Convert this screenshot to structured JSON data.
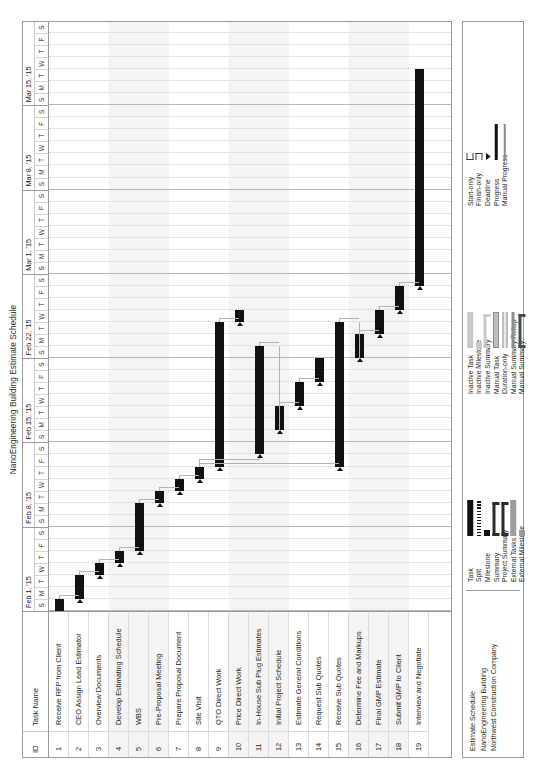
{
  "document": {
    "title": "NanoEngineering Building Estimate Schedule"
  },
  "table": {
    "headers": {
      "id": "ID",
      "name": "Task Name"
    },
    "rows": [
      {
        "id": "1",
        "name": "Receive RFP from Client"
      },
      {
        "id": "2",
        "name": "CEO Assign Lead Estimator"
      },
      {
        "id": "3",
        "name": "Overview Documents"
      },
      {
        "id": "4",
        "name": "Develop Estimating Schedule"
      },
      {
        "id": "5",
        "name": "WBS"
      },
      {
        "id": "6",
        "name": "Pre-Proposal Meeting"
      },
      {
        "id": "7",
        "name": "Prepare Proposal Document"
      },
      {
        "id": "8",
        "name": "Site Visit"
      },
      {
        "id": "9",
        "name": "QTO Direct Work"
      },
      {
        "id": "10",
        "name": "Price Direct Work"
      },
      {
        "id": "11",
        "name": "In-House Sub Plug Estimates"
      },
      {
        "id": "12",
        "name": "Initial Project Schedule"
      },
      {
        "id": "13",
        "name": "Estimate General Conditions"
      },
      {
        "id": "14",
        "name": "Request Sub Quotes"
      },
      {
        "id": "15",
        "name": "Receive Sub Quotes"
      },
      {
        "id": "16",
        "name": "Determine Fee and Markups"
      },
      {
        "id": "17",
        "name": "Final GMP Estimate"
      },
      {
        "id": "18",
        "name": "Submit GMP to Client"
      },
      {
        "id": "19",
        "name": "Interview and Negotiate"
      }
    ]
  },
  "timescale": {
    "weeks": [
      {
        "label": "Feb 1, '15",
        "days": [
          "S",
          "M",
          "T",
          "W",
          "T",
          "F",
          "S"
        ]
      },
      {
        "label": "Feb 8, '15",
        "days": [
          "S",
          "M",
          "T",
          "W",
          "T",
          "F",
          "S"
        ]
      },
      {
        "label": "Feb 15, '15",
        "days": [
          "S",
          "M",
          "T",
          "W",
          "T",
          "F",
          "S"
        ]
      },
      {
        "label": "Feb 22, '15",
        "days": [
          "S",
          "M",
          "T",
          "W",
          "T",
          "F",
          "S"
        ]
      },
      {
        "label": "Mar 1, '15",
        "days": [
          "S",
          "M",
          "T",
          "W",
          "T",
          "F",
          "S"
        ]
      },
      {
        "label": "Mar 8, '15",
        "days": [
          "S",
          "M",
          "T",
          "W",
          "T",
          "F",
          "S"
        ]
      },
      {
        "label": "Mar 15, '15",
        "days": [
          "S",
          "M",
          "T",
          "W",
          "T",
          "F",
          "S"
        ]
      }
    ]
  },
  "chart_data": {
    "type": "bar",
    "title": "NanoEngineering Building Estimate Schedule",
    "xlabel": "",
    "ylabel": "",
    "x_axis_unit": "day",
    "x_start": "2015-02-01",
    "x_end": "2015-03-21",
    "grid": true,
    "legend_position": "bottom",
    "categories": [
      "Receive RFP from Client",
      "CEO Assign Lead Estimator",
      "Overview Documents",
      "Develop Estimating Schedule",
      "WBS",
      "Pre-Proposal Meeting",
      "Prepare Proposal Document",
      "Site Visit",
      "QTO Direct Work",
      "Price Direct Work",
      "In-House Sub Plug Estimates",
      "Initial Project Schedule",
      "Estimate General Conditions",
      "Request Sub Quotes",
      "Receive Sub Quotes",
      "Determine Fee and Markups",
      "Final GMP Estimate",
      "Submit GMP to Client",
      "Interview and Negotiate"
    ],
    "bars": [
      {
        "id": "1",
        "start_day": 1,
        "duration_days": 1
      },
      {
        "id": "2",
        "start_day": 2,
        "duration_days": 2
      },
      {
        "id": "3",
        "start_day": 4,
        "duration_days": 1
      },
      {
        "id": "4",
        "start_day": 5,
        "duration_days": 1
      },
      {
        "id": "5",
        "start_day": 6,
        "duration_days": 4
      },
      {
        "id": "6",
        "start_day": 10,
        "duration_days": 1
      },
      {
        "id": "7",
        "start_day": 11,
        "duration_days": 1
      },
      {
        "id": "8",
        "start_day": 12,
        "duration_days": 1
      },
      {
        "id": "9",
        "start_day": 13,
        "duration_days": 12
      },
      {
        "id": "10",
        "start_day": 25,
        "duration_days": 1
      },
      {
        "id": "11",
        "start_day": 14,
        "duration_days": 9
      },
      {
        "id": "12",
        "start_day": 16,
        "duration_days": 2
      },
      {
        "id": "13",
        "start_day": 18,
        "duration_days": 2
      },
      {
        "id": "14",
        "start_day": 20,
        "duration_days": 2
      },
      {
        "id": "15",
        "start_day": 13,
        "duration_days": 12
      },
      {
        "id": "16",
        "start_day": 22,
        "duration_days": 2
      },
      {
        "id": "17",
        "start_day": 24,
        "duration_days": 2
      },
      {
        "id": "18",
        "start_day": 26,
        "duration_days": 2
      },
      {
        "id": "19",
        "start_day": 28,
        "duration_days": 18
      }
    ]
  },
  "legend": {
    "info_lines": [
      "Estimate Schedule",
      "NanoEngineering Building",
      "Northwest Construction Company"
    ],
    "columns": [
      [
        {
          "label": "Task",
          "symbol": "task-bar"
        },
        {
          "label": "Split",
          "symbol": "split-bar"
        },
        {
          "label": "Milestone",
          "symbol": "milestone-diamond"
        },
        {
          "label": "Summary",
          "symbol": "summary-bracket"
        },
        {
          "label": "Project Summary",
          "symbol": "project-summary-bracket"
        },
        {
          "label": "External Tasks",
          "symbol": "external-task-bar"
        },
        {
          "label": "External Milestone",
          "symbol": "external-milestone-diamond"
        }
      ],
      [
        {
          "label": "Inactive Task",
          "symbol": "inactive-task-bar"
        },
        {
          "label": "Inactive Milestone",
          "symbol": "inactive-milestone-diamond"
        },
        {
          "label": "Inactive Summary",
          "symbol": "inactive-summary-bracket"
        },
        {
          "label": "Manual Task",
          "symbol": "manual-task-bar"
        },
        {
          "label": "Duration-only",
          "symbol": "duration-only-bar"
        },
        {
          "label": "Manual Summary Rollup",
          "symbol": "manual-summary-rollup-bar"
        },
        {
          "label": "Manual Summary",
          "symbol": "manual-summary-bracket"
        }
      ],
      [
        {
          "label": "Start-only",
          "symbol": "start-only-bracket"
        },
        {
          "label": "Finish-only",
          "symbol": "finish-only-bracket"
        },
        {
          "label": "Deadline",
          "symbol": "deadline-arrow"
        },
        {
          "label": "Progress",
          "symbol": "progress-line"
        },
        {
          "label": "Manual Progress",
          "symbol": "manual-progress-line"
        }
      ]
    ]
  },
  "colors": {
    "bar": "#111111",
    "link": "#b3b3b3",
    "band": "#f4f4f4",
    "border": "#9a9a9a"
  }
}
